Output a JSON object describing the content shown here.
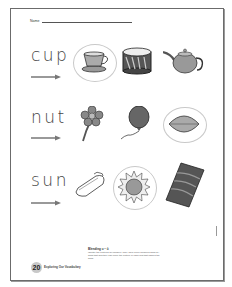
{
  "worksheet": {
    "name_label": "Name",
    "rows": [
      {
        "word": "cup",
        "pictures": [
          {
            "icon": "teacup-icon",
            "label": "cup",
            "circled": true
          },
          {
            "icon": "drum-icon",
            "label": "drum",
            "circled": false
          },
          {
            "icon": "teapot-icon",
            "label": "teapot",
            "circled": false
          }
        ]
      },
      {
        "word": "nut",
        "pictures": [
          {
            "icon": "flower-icon",
            "label": "flower",
            "circled": false
          },
          {
            "icon": "balloon-icon",
            "label": "balloon",
            "circled": false
          },
          {
            "icon": "nut-icon",
            "label": "nut",
            "circled": true
          }
        ]
      },
      {
        "word": "sun",
        "pictures": [
          {
            "icon": "soap-icon",
            "label": "soap",
            "circled": false
          },
          {
            "icon": "sun-icon",
            "label": "sun",
            "circled": true
          },
          {
            "icon": "rug-icon",
            "label": "rug",
            "circled": false
          }
        ]
      }
    ],
    "footer": {
      "title": "Blending u – ǔ",
      "instructions": "Identify the pictures for children. They have been modeled word-by-word that and they can circle the picture in each row that names the word.",
      "page_number": "20",
      "book_title": "Exploring Our Vocabulary"
    },
    "colors": {
      "border": "#6b6b6b",
      "text": "#444444",
      "circle": "#c9c9c9",
      "picture_fill": "#9a9a9a"
    }
  }
}
